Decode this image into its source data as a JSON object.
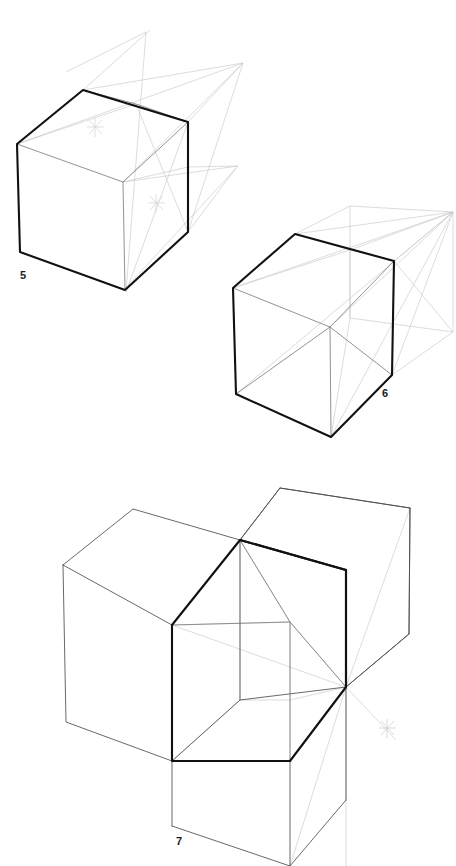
{
  "document": {
    "title": "Perspective cube construction exercises",
    "background_color": "#ffffff",
    "width": 456,
    "height": 866,
    "medium": "pencil line drawing"
  },
  "style": {
    "ink_heavy": "#111111",
    "ink_medium": "#4a4a4a",
    "ink_light": "#9a9a9a",
    "ink_faint": "#c9c9c9",
    "ink_ghost": "#dcdcdc",
    "heavy_width": 2.1,
    "medium_width": 0.9,
    "light_width": 0.7,
    "faint_width": 0.6
  },
  "figures": [
    {
      "id": "figure-5",
      "label": "5",
      "label_x": 20,
      "label_y": 279,
      "caption": "Two-point perspective cube with construction lines to left and right vanishing points",
      "cube": {
        "top_left": [
          17,
          144
        ],
        "top_back": [
          83,
          90
        ],
        "top_apex": [
          136,
          104
        ],
        "top_right": [
          188,
          122
        ],
        "front_center_top": [
          123,
          182
        ],
        "front_center_bottom": [
          125,
          290
        ],
        "bottom_left": [
          20,
          252
        ],
        "bottom_right": [
          188,
          232
        ]
      },
      "markers": [
        {
          "name": "center-star-top-face",
          "x": 95,
          "y": 127
        },
        {
          "name": "center-star-right-face",
          "x": 156,
          "y": 203
        }
      ],
      "vanishing_points": [
        {
          "name": "vp-upper-right",
          "x": 243,
          "y": 63
        },
        {
          "name": "vp-upper-left",
          "x": 146,
          "y": 32
        },
        {
          "name": "vp-lower-right",
          "x": 238,
          "y": 166
        }
      ]
    },
    {
      "id": "figure-6",
      "label": "6",
      "label_x": 388,
      "label_y": 397,
      "caption": "Cube with a second ghosted cube projected to the right-hand vanishing point",
      "cube": {
        "top_left": [
          233,
          288
        ],
        "top_back": [
          295,
          234
        ],
        "top_apex": [
          350,
          250
        ],
        "top_right": [
          394,
          261
        ],
        "front_center_top": [
          330,
          327
        ],
        "front_center_bottom": [
          331,
          437
        ],
        "bottom_left": [
          236,
          394
        ],
        "bottom_right": [
          392,
          375
        ]
      },
      "vanishing_points": [
        {
          "name": "vp-right",
          "x": 453,
          "y": 212
        }
      ]
    },
    {
      "id": "figure-7",
      "label": "7",
      "label_x": 180,
      "label_y": 845,
      "caption": "Three stacked cubes in two-point perspective sharing one corner and vanishing point",
      "cubes": [
        {
          "name": "cube-left",
          "emphasis": "light"
        },
        {
          "name": "cube-right-front",
          "emphasis": "heavy"
        },
        {
          "name": "cube-below",
          "emphasis": "light"
        },
        {
          "name": "cube-right-back",
          "emphasis": "light"
        }
      ],
      "markers": [
        {
          "name": "corner-star",
          "x": 387,
          "y": 728
        }
      ],
      "vanishing_points": [
        {
          "name": "vp-shared-corner",
          "x": 346,
          "y": 687
        }
      ]
    }
  ]
}
